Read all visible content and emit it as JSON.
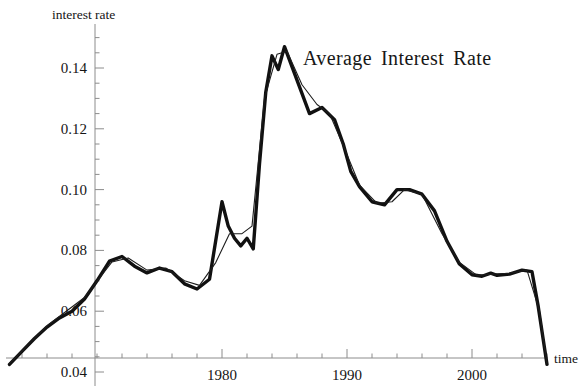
{
  "chart_data": {
    "type": "line",
    "title_words": [
      "Average",
      "Interest",
      "Rate"
    ],
    "xlabel": "time",
    "ylabel": "interest rate",
    "xlim": [
      1961.5,
      2006.5
    ],
    "ylim": [
      0.0405,
      0.1515
    ],
    "grid": false,
    "legend": null,
    "x_major_ticks": [
      1980,
      1990,
      2000
    ],
    "x_major_tick_labels": [
      "1980",
      "1990",
      "2000"
    ],
    "x_minor_tick_step": 2,
    "y_major_ticks": [
      0.04,
      0.06,
      0.08,
      0.1,
      0.12,
      0.14
    ],
    "y_major_tick_labels": [
      "0.04",
      "0.06",
      "0.08",
      "0.10",
      "0.12",
      "0.14"
    ],
    "y_minor_tick_step": 0.005,
    "axis_color": "#8c8c8c",
    "series": [
      {
        "name": "observed",
        "style": "thick",
        "color": "#111111",
        "width": 3.4,
        "x": [
          1963.0,
          1964.0,
          1965.0,
          1966.0,
          1967.0,
          1968.0,
          1969.0,
          1970.0,
          1971.0,
          1972.0,
          1973.0,
          1974.0,
          1975.0,
          1976.0,
          1977.0,
          1978.0,
          1979.0,
          1980.0,
          1980.5,
          1981.0,
          1981.5,
          1982.0,
          1982.5,
          1983.0,
          1983.5,
          1984.0,
          1984.5,
          1985.0,
          1986.0,
          1987.0,
          1988.0,
          1989.0,
          1989.7,
          1990.3,
          1991.0,
          1992.0,
          1993.0,
          1994.0,
          1995.0,
          1996.0,
          1997.0,
          1998.0,
          1999.0,
          2000.0,
          2000.8,
          2001.5,
          2002.0,
          2003.0,
          2004.0,
          2004.8,
          2005.3,
          2006.0
        ],
        "y": [
          0.0425,
          0.0468,
          0.051,
          0.0548,
          0.0578,
          0.06,
          0.064,
          0.07,
          0.0765,
          0.078,
          0.0748,
          0.0726,
          0.0742,
          0.073,
          0.069,
          0.0673,
          0.0705,
          0.096,
          0.088,
          0.084,
          0.0815,
          0.084,
          0.0805,
          0.1085,
          0.132,
          0.144,
          0.1395,
          0.147,
          0.136,
          0.125,
          0.127,
          0.123,
          0.115,
          0.106,
          0.101,
          0.096,
          0.095,
          0.1,
          0.1,
          0.0985,
          0.093,
          0.083,
          0.0755,
          0.072,
          0.0715,
          0.0725,
          0.0718,
          0.0722,
          0.0735,
          0.073,
          0.0615,
          0.0425
        ]
      },
      {
        "name": "smoothed",
        "style": "thin",
        "color": "#1d1d1d",
        "width": 1.1,
        "x": [
          1963.0,
          1966.0,
          1969.0,
          1971.2,
          1972.5,
          1974.0,
          1975.5,
          1977.0,
          1978.2,
          1979.5,
          1980.6,
          1981.6,
          1982.4,
          1983.4,
          1984.4,
          1985.2,
          1986.4,
          1987.6,
          1988.6,
          1989.8,
          1991.0,
          1992.4,
          1993.6,
          1994.6,
          1996.0,
          1997.6,
          1999.0,
          2000.4,
          2001.6,
          2003.0,
          2004.4,
          2005.4,
          2006.0
        ],
        "y": [
          0.0428,
          0.0552,
          0.0645,
          0.0762,
          0.0775,
          0.0735,
          0.0742,
          0.07,
          0.0685,
          0.076,
          0.0855,
          0.0855,
          0.088,
          0.13,
          0.1445,
          0.1455,
          0.1345,
          0.128,
          0.125,
          0.1135,
          0.1015,
          0.0955,
          0.096,
          0.1,
          0.0985,
          0.0855,
          0.076,
          0.0718,
          0.0722,
          0.0725,
          0.0735,
          0.06,
          0.0428
        ]
      }
    ],
    "notable_points": [
      {
        "label": "first local peak",
        "x": 1972.0,
        "y": 0.078
      },
      {
        "label": "mid-70s peak",
        "x": 1980.0,
        "y": 0.096
      },
      {
        "label": "global maximum",
        "x": 1985.0,
        "y": 0.147
      },
      {
        "label": "1990 local peak",
        "x": 1994.0,
        "y": 0.1
      },
      {
        "label": "2001 plateau",
        "x": 2004.0,
        "y": 0.0735
      },
      {
        "label": "minimum at end",
        "x": 2006.0,
        "y": 0.0425
      }
    ]
  },
  "axes": {
    "y_axis_title": "interest rate",
    "x_axis_title": "time"
  }
}
